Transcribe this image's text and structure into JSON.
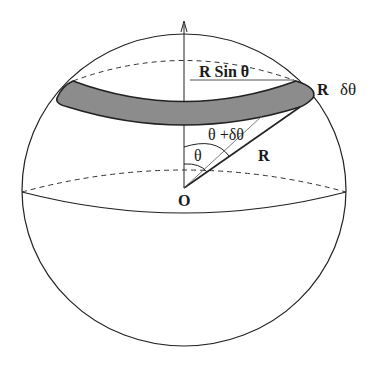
{
  "diagram": {
    "type": "sphere-zone-geometry",
    "labels": {
      "r_sin_theta": "R Sin  θ",
      "r_edge": "R",
      "delta_theta": "δθ",
      "theta_plus_delta": "θ +δθ",
      "theta": "θ",
      "radius": "R",
      "origin": "O"
    },
    "colors": {
      "line": "#222222",
      "band_fill": "#8c8c8c",
      "background": "#ffffff"
    }
  }
}
